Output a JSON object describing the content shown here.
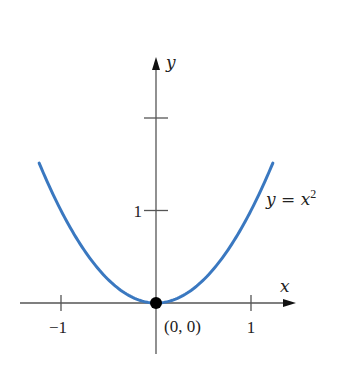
{
  "chart_data": {
    "type": "line",
    "title": "",
    "xlabel": "x",
    "ylabel": "y",
    "xlim": [
      -1.45,
      1.45
    ],
    "ylim": [
      -0.6,
      2.6
    ],
    "grid": false,
    "x_ticks": [
      {
        "value": -1,
        "label": "−1"
      },
      {
        "value": 1,
        "label": "1"
      }
    ],
    "y_ticks": [
      {
        "value": 1,
        "label": "1"
      },
      {
        "value": 2,
        "label": ""
      }
    ],
    "series": [
      {
        "name": "y = x²",
        "function": "x^2",
        "domain": [
          -1.23,
          1.23
        ],
        "color": "#3a78c0",
        "x": [
          -1.23,
          -1.0,
          -0.75,
          -0.5,
          -0.25,
          0,
          0.25,
          0.5,
          0.75,
          1.0,
          1.23
        ],
        "y": [
          1.5129,
          1.0,
          0.5625,
          0.25,
          0.0625,
          0,
          0.0625,
          0.25,
          0.5625,
          1.0,
          1.5129
        ]
      }
    ],
    "annotations": [
      {
        "type": "point",
        "x": 0,
        "y": 0,
        "label": "(0, 0)",
        "color": "#000000"
      },
      {
        "type": "curve-label",
        "text_base": "y = x",
        "text_sup": "2",
        "anchor_x": 1.2,
        "anchor_y": 1.0
      }
    ]
  }
}
